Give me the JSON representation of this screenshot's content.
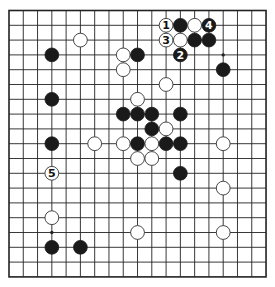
{
  "board": {
    "size": 19,
    "origin_px": [
      9,
      10.5
    ],
    "spacing_px": [
      14.28,
      14.8
    ],
    "stone_radius_px": 6.9,
    "colors": {
      "line": "#222222",
      "black": "#1a1a1a",
      "white": "#ffffff",
      "background": "#ffffff"
    },
    "star_points": [
      [
        3,
        3
      ],
      [
        9,
        3
      ],
      [
        15,
        3
      ],
      [
        3,
        9
      ],
      [
        9,
        9
      ],
      [
        15,
        9
      ],
      [
        3,
        15
      ],
      [
        9,
        15
      ],
      [
        15,
        15
      ]
    ],
    "stones": [
      {
        "color": "white",
        "col": 11,
        "row": 1,
        "label": "1"
      },
      {
        "color": "black",
        "col": 12,
        "row": 1,
        "label": ""
      },
      {
        "color": "white",
        "col": 13,
        "row": 1,
        "label": ""
      },
      {
        "color": "black",
        "col": 14,
        "row": 1,
        "label": "4"
      },
      {
        "color": "white",
        "col": 11,
        "row": 2,
        "label": "3"
      },
      {
        "color": "white",
        "col": 12,
        "row": 2,
        "label": ""
      },
      {
        "color": "black",
        "col": 13,
        "row": 2,
        "label": ""
      },
      {
        "color": "black",
        "col": 14,
        "row": 2,
        "label": ""
      },
      {
        "color": "white",
        "col": 5,
        "row": 2,
        "label": ""
      },
      {
        "color": "black",
        "col": 12,
        "row": 3,
        "label": "2"
      },
      {
        "color": "black",
        "col": 3,
        "row": 3,
        "label": ""
      },
      {
        "color": "white",
        "col": 8,
        "row": 3,
        "label": ""
      },
      {
        "color": "black",
        "col": 9,
        "row": 3,
        "label": ""
      },
      {
        "color": "white",
        "col": 8,
        "row": 4,
        "label": ""
      },
      {
        "color": "black",
        "col": 15,
        "row": 4,
        "label": ""
      },
      {
        "color": "white",
        "col": 11,
        "row": 5,
        "label": ""
      },
      {
        "color": "black",
        "col": 3,
        "row": 6,
        "label": ""
      },
      {
        "color": "white",
        "col": 9,
        "row": 6,
        "label": ""
      },
      {
        "color": "black",
        "col": 8,
        "row": 7,
        "label": ""
      },
      {
        "color": "black",
        "col": 9,
        "row": 7,
        "label": ""
      },
      {
        "color": "black",
        "col": 10,
        "row": 7,
        "label": ""
      },
      {
        "color": "black",
        "col": 12,
        "row": 7,
        "label": ""
      },
      {
        "color": "black",
        "col": 10,
        "row": 8,
        "label": ""
      },
      {
        "color": "white",
        "col": 11,
        "row": 8,
        "label": ""
      },
      {
        "color": "black",
        "col": 3,
        "row": 9,
        "label": ""
      },
      {
        "color": "white",
        "col": 6,
        "row": 9,
        "label": ""
      },
      {
        "color": "white",
        "col": 8,
        "row": 9,
        "label": ""
      },
      {
        "color": "black",
        "col": 9,
        "row": 9,
        "label": ""
      },
      {
        "color": "white",
        "col": 10,
        "row": 9,
        "label": ""
      },
      {
        "color": "black",
        "col": 11,
        "row": 9,
        "label": ""
      },
      {
        "color": "black",
        "col": 12,
        "row": 9,
        "label": ""
      },
      {
        "color": "white",
        "col": 15,
        "row": 9,
        "label": ""
      },
      {
        "color": "white",
        "col": 9,
        "row": 10,
        "label": ""
      },
      {
        "color": "white",
        "col": 10,
        "row": 10,
        "label": ""
      },
      {
        "color": "white",
        "col": 3,
        "row": 11,
        "label": "5"
      },
      {
        "color": "black",
        "col": 12,
        "row": 11,
        "label": ""
      },
      {
        "color": "white",
        "col": 15,
        "row": 12,
        "label": ""
      },
      {
        "color": "white",
        "col": 3,
        "row": 14,
        "label": ""
      },
      {
        "color": "white",
        "col": 9,
        "row": 15,
        "label": ""
      },
      {
        "color": "white",
        "col": 15,
        "row": 15,
        "label": ""
      },
      {
        "color": "black",
        "col": 3,
        "row": 16,
        "label": ""
      },
      {
        "color": "black",
        "col": 5,
        "row": 16,
        "label": ""
      }
    ]
  }
}
